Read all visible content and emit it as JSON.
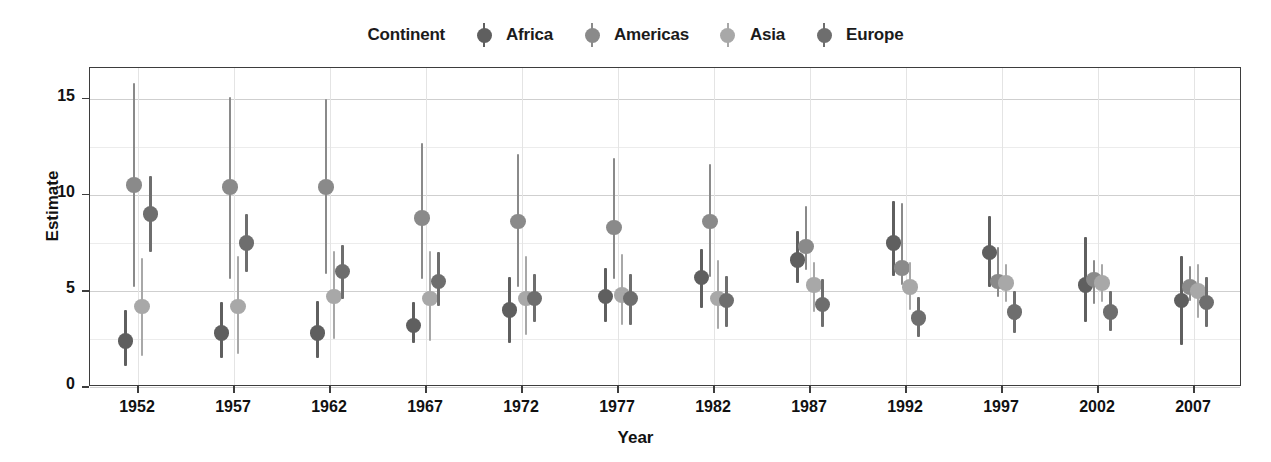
{
  "legend": {
    "title": "Continent",
    "entries": [
      {
        "label": "Africa",
        "color": "#5f5f5f"
      },
      {
        "label": "Americas",
        "color": "#8a8a8a"
      },
      {
        "label": "Asia",
        "color": "#a8a8a8"
      },
      {
        "label": "Europe",
        "color": "#6e6e6e"
      }
    ]
  },
  "axes": {
    "xlabel": "Year",
    "ylabel": "Estimate",
    "y_ticks": [
      0,
      5,
      10,
      15
    ],
    "y_minor": [
      2.5,
      7.5,
      12.5
    ],
    "ylim": [
      0,
      16.6
    ],
    "x_ticks": [
      1952,
      1957,
      1962,
      1967,
      1972,
      1977,
      1982,
      1987,
      1992,
      1997,
      2002,
      2007
    ]
  },
  "chart_data": {
    "type": "scatter",
    "title": "",
    "xlabel": "Year",
    "ylabel": "Estimate",
    "ylim": [
      0,
      16.6
    ],
    "grid": true,
    "legend_position": "top-center",
    "legend_title": "Continent",
    "categories": [
      1952,
      1957,
      1962,
      1967,
      1972,
      1977,
      1982,
      1987,
      1992,
      1997,
      2002,
      2007
    ],
    "series": [
      {
        "name": "Africa",
        "color": "#5f5f5f",
        "values": [
          2.4,
          2.8,
          2.8,
          3.2,
          4.0,
          4.7,
          5.7,
          6.6,
          7.5,
          7.0,
          5.3,
          4.5
        ],
        "ci_low": [
          1.1,
          1.5,
          1.5,
          2.3,
          2.3,
          3.4,
          4.1,
          5.4,
          5.8,
          5.2,
          3.4,
          2.2
        ],
        "ci_high": [
          4.0,
          4.4,
          4.5,
          4.4,
          5.7,
          6.2,
          7.2,
          8.1,
          9.7,
          8.9,
          7.8,
          6.8
        ]
      },
      {
        "name": "Americas",
        "color": "#8a8a8a",
        "values": [
          10.5,
          10.4,
          10.4,
          8.8,
          8.6,
          8.3,
          8.6,
          7.3,
          6.2,
          5.5,
          5.6,
          5.2
        ],
        "ci_low": [
          5.2,
          5.6,
          5.9,
          5.6,
          5.2,
          5.6,
          5.7,
          6.1,
          5.3,
          4.7,
          4.3,
          4.5
        ],
        "ci_high": [
          15.8,
          15.1,
          15.0,
          12.7,
          12.1,
          11.9,
          11.6,
          9.4,
          9.6,
          7.3,
          6.6,
          6.3
        ]
      },
      {
        "name": "Asia",
        "color": "#a8a8a8",
        "values": [
          4.2,
          4.2,
          4.7,
          4.6,
          4.6,
          4.8,
          4.6,
          5.3,
          5.2,
          5.4,
          5.4,
          5.0
        ],
        "ci_low": [
          1.6,
          1.7,
          2.5,
          2.4,
          2.7,
          3.2,
          3.0,
          3.9,
          4.0,
          4.4,
          4.4,
          3.6
        ],
        "ci_high": [
          6.7,
          6.8,
          7.1,
          7.1,
          6.8,
          6.9,
          6.6,
          6.5,
          6.5,
          6.4,
          6.4,
          6.4
        ]
      },
      {
        "name": "Europe",
        "color": "#6e6e6e",
        "values": [
          9.0,
          7.5,
          6.0,
          5.5,
          4.6,
          4.6,
          4.5,
          4.3,
          3.6,
          3.9,
          3.9,
          4.4
        ],
        "ci_low": [
          7.0,
          6.0,
          4.6,
          4.2,
          3.4,
          3.2,
          3.1,
          3.1,
          2.6,
          2.8,
          2.9,
          3.1
        ],
        "ci_high": [
          11.0,
          9.0,
          7.4,
          7.0,
          5.9,
          5.9,
          5.8,
          5.6,
          4.7,
          5.0,
          5.0,
          5.7
        ]
      }
    ]
  }
}
